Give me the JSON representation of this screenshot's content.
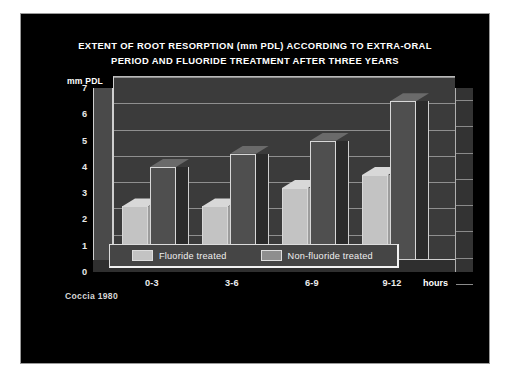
{
  "slide": {
    "title_line_1": "EXTENT OF ROOT RESORPTION (mm PDL) ACCORDING TO EXTRA-ORAL",
    "title_line_2": "PERIOD AND FLUORIDE TREATMENT AFTER THREE YEARS",
    "source_credit": "Coccia 1980",
    "background_color": "#000000",
    "frame_color": "#9a9a9a"
  },
  "legend": {
    "entries": [
      {
        "label": "Fluoride treated",
        "swatch": "light",
        "color": "#c3c3c3"
      },
      {
        "label": "Non-fluoride treated",
        "swatch": "dark",
        "color": "#8e8e8e"
      }
    ]
  },
  "axis": {
    "y_title": "mm PDL",
    "y_ticks": [
      "7",
      "6",
      "5",
      "4",
      "3",
      "2",
      "1",
      "0"
    ],
    "x_unit_label": "hours"
  },
  "chart_data": {
    "type": "bar",
    "title": "EXTENT OF ROOT RESORPTION (mm PDL) ACCORDING TO EXTRA-ORAL PERIOD AND FLUORIDE TREATMENT AFTER THREE YEARS",
    "xlabel": "hours",
    "ylabel": "mm PDL",
    "ylim": [
      0,
      7
    ],
    "ytick_step": 1,
    "grid": true,
    "legend_position": "bottom",
    "three_d": true,
    "categories": [
      "0-3",
      "3-6",
      "6-9",
      "9-12"
    ],
    "series": [
      {
        "name": "Fluoride treated",
        "color": "#c3c3c3",
        "values": [
          2.0,
          2.0,
          2.7,
          3.2
        ]
      },
      {
        "name": "Non-fluoride treated",
        "color": "#4f4f4f",
        "values": [
          3.5,
          4.0,
          4.5,
          6.0
        ]
      }
    ],
    "annotations": [
      "Coccia 1980"
    ]
  }
}
